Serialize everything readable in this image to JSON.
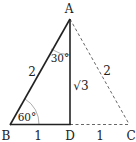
{
  "diagram": {
    "type": "geometry",
    "vertices": {
      "A": {
        "label": "A",
        "x": 69,
        "y": 19
      },
      "B": {
        "label": "B",
        "x": 10,
        "y": 125
      },
      "C": {
        "label": "C",
        "x": 129,
        "y": 125
      },
      "D": {
        "label": "D",
        "x": 70,
        "y": 125
      }
    },
    "segments": [
      {
        "from": "A",
        "to": "B",
        "style": "solid",
        "length_label": "2"
      },
      {
        "from": "A",
        "to": "D",
        "style": "solid",
        "length_label": "√3"
      },
      {
        "from": "B",
        "to": "D",
        "style": "solid",
        "length_label": "1"
      },
      {
        "from": "A",
        "to": "C",
        "style": "dashed",
        "length_label": "2"
      },
      {
        "from": "D",
        "to": "C",
        "style": "dashed",
        "length_label": "1"
      }
    ],
    "angles": [
      {
        "vertex": "B",
        "label": "60°"
      },
      {
        "vertex": "A",
        "label": "30°"
      },
      {
        "vertex": "D",
        "label": "90°",
        "marker": "right-angle"
      }
    ],
    "labels": {
      "A": "A",
      "B": "B",
      "C": "C",
      "D": "D",
      "ab": "2",
      "ac": "2",
      "ad": "√3",
      "bd": "1",
      "dc": "1",
      "angle_b": "60°",
      "angle_a": "30°"
    },
    "colors": {
      "solid_line": "#222222",
      "dashed_line": "#555555",
      "arc": "#888888"
    }
  }
}
